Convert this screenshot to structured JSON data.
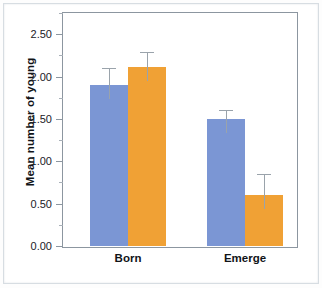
{
  "chart_data": {
    "type": "bar",
    "title": "",
    "subtitle": "",
    "xlabel": "",
    "ylabel": "Mean number of young",
    "categories": [
      "Born",
      "Emerge"
    ],
    "series": [
      {
        "name": "blue",
        "color": "#7b96d4",
        "values": [
          1.9,
          1.5
        ],
        "error_upper": [
          0.2,
          0.1
        ]
      },
      {
        "name": "orange",
        "color": "#f0a135",
        "values": [
          2.11,
          0.6
        ],
        "error_upper": [
          0.18,
          0.25
        ]
      }
    ],
    "ylim": [
      0.0,
      2.75
    ],
    "ytick_labels": [
      "0.00",
      "0.50",
      "1.00",
      "1.50",
      "2.00",
      "2.50"
    ],
    "ytick_values": [
      0.0,
      0.5,
      1.0,
      1.5,
      2.0,
      2.5
    ],
    "yminor_values": [
      0.25,
      0.75,
      1.25,
      1.75,
      2.25,
      2.75
    ],
    "grid": false,
    "legend": "none",
    "error_bars": "upper-only-t-cap",
    "colors": {
      "bar_blue": "#7b96d4",
      "bar_orange": "#f0a135",
      "axis": "#8c96a0",
      "error": "#9aa3ab",
      "text": "#111418",
      "background": "#ffffff"
    }
  }
}
